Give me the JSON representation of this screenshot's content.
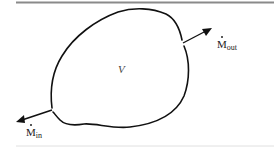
{
  "diagram": {
    "type": "control-volume",
    "volume_label": "V",
    "inlet": {
      "symbol": "M",
      "subscript": "in",
      "dot": true
    },
    "outlet": {
      "symbol": "M",
      "subscript": "out",
      "dot": true
    },
    "colors": {
      "stroke": "#111111",
      "top_rule": "#8a8a8a",
      "bottom_rule": "#d8d8d8",
      "background": "#ffffff"
    }
  }
}
